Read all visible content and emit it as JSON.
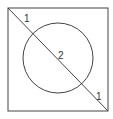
{
  "diagram": {
    "type": "geometry",
    "square": {
      "x": 8,
      "y": 8,
      "width": 100,
      "height": 103,
      "stroke": "#444444"
    },
    "diagonal": {
      "x1": 8,
      "y1": 8,
      "x2": 108,
      "y2": 111,
      "stroke": "#444444"
    },
    "circle": {
      "cx": 58,
      "cy": 58,
      "r": 35,
      "stroke": "#444444"
    },
    "labels": [
      {
        "text": "1",
        "x": 24,
        "y": 22
      },
      {
        "text": "2",
        "x": 58,
        "y": 59
      },
      {
        "text": "1",
        "x": 96,
        "y": 100
      }
    ]
  }
}
